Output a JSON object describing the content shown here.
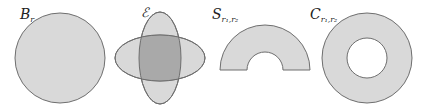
{
  "figure": {
    "colors": {
      "fill": "#d9d9d9",
      "overlap_fill": "#a9a9a9",
      "stroke": "#6e6e6e",
      "background": "#ffffff"
    },
    "shapes": [
      {
        "id": "ball",
        "label_main": "B",
        "label_sub": "r",
        "kind": "disk"
      },
      {
        "id": "ellipses",
        "label_main": "ℰ",
        "label_sub": "",
        "kind": "two-crossed-ellipses"
      },
      {
        "id": "half-annulus",
        "label_main": "S",
        "label_sub": "r₁,r₂",
        "kind": "half-annulus"
      },
      {
        "id": "annulus",
        "label_main": "C",
        "label_sub": "r₁,r₂",
        "kind": "annulus"
      }
    ]
  }
}
